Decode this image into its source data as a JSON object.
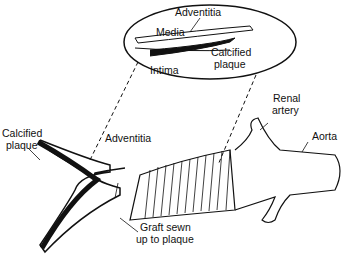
{
  "diagram": {
    "labels": {
      "media": "Media",
      "adventitia_inset": "Adventitia",
      "intima": "Intima",
      "calcified_plaque_inset_1": "Calcified",
      "calcified_plaque_inset_2": "plaque",
      "calcified_plaque_1": "Calcified",
      "calcified_plaque_2": "plaque",
      "adventitia": "Adventitia",
      "renal_artery_1": "Renal",
      "renal_artery_2": "artery",
      "aorta": "Aorta",
      "graft_1": "Graft sewn",
      "graft_2": "up to plaque"
    },
    "colors": {
      "stroke": "#111111",
      "background": "#ffffff"
    }
  }
}
